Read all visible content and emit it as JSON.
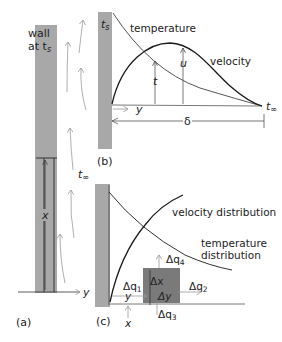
{
  "diagram": {
    "panel_a": {
      "label": "(a)",
      "wall_label_line1": "wall",
      "wall_label_line2": "at t",
      "wall_label_sub": "s",
      "free_stream_label": "t",
      "free_stream_sub": "∞",
      "x_axis_label": "x",
      "y_axis_label": "y"
    },
    "panel_b": {
      "label": "(b)",
      "wall_temp_label": "t",
      "wall_temp_sub": "s",
      "temperature_curve_label": "temperature",
      "velocity_curve_label": "velocity",
      "t_marker": "t",
      "u_marker": "u",
      "y_axis_label": "y",
      "boundary_thickness_label": "δ",
      "free_stream_label": "t",
      "free_stream_sub": "∞"
    },
    "panel_c": {
      "label": "(c)",
      "velocity_distribution_label": "velocity distribution",
      "temperature_distribution_line1": "temperature",
      "temperature_distribution_line2": "distribution",
      "dq1": "Δq",
      "dq1_sub": "1",
      "dq2": "Δq",
      "dq2_sub": "2",
      "dq3": "Δq",
      "dq3_sub": "3",
      "dq4": "Δq",
      "dq4_sub": "4",
      "dx": "Δx",
      "dy": "Δy",
      "y_label": "y",
      "x_label": "x"
    },
    "colors": {
      "wall_gray": "#a8a8a8",
      "element_gray": "#7a7a7a",
      "curve_dark": "#1a1a1a",
      "arrow_gray": "#9a9a9a"
    }
  }
}
